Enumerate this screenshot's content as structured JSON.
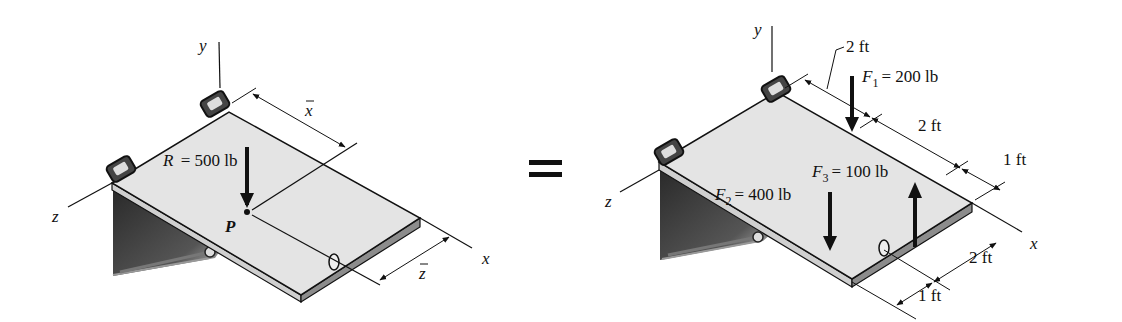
{
  "left_figure": {
    "axis_labels": {
      "x": "x",
      "y": "y",
      "z": "z"
    },
    "resultant_label": "R = 500 lb",
    "resultant_symbol": "R",
    "resultant_value": "= 500 lb",
    "point_label": "P",
    "dim_xbar": "x",
    "dim_zbar": "z"
  },
  "equals_sign": "=",
  "right_figure": {
    "axis_labels": {
      "x": "x",
      "y": "y",
      "z": "z"
    },
    "forces": [
      {
        "symbol": "F",
        "sub": "1",
        "value": "= 200 lb",
        "direction": "down"
      },
      {
        "symbol": "F",
        "sub": "2",
        "value": "= 400 lb",
        "direction": "down"
      },
      {
        "symbol": "F",
        "sub": "3",
        "value": "= 100 lb",
        "direction": "up"
      }
    ],
    "dims_along_x": [
      "2 ft",
      "2 ft",
      "1 ft"
    ],
    "dims_along_z": [
      "2 ft",
      "1 ft"
    ]
  },
  "colors": {
    "plate_top": "#e4e4e4",
    "plate_edge": "#8c8c8c",
    "bracket": "#3a3a3a",
    "ink": "#111111"
  }
}
